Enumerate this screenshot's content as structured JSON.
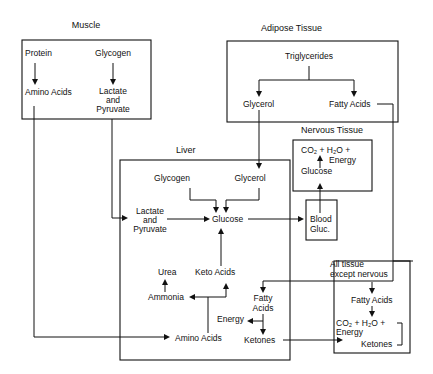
{
  "diagram": {
    "type": "metabolic-flow",
    "sections": {
      "muscle": {
        "title": "Muscle",
        "nodes": {
          "protein": "Protein",
          "glycogen": "Glycogen",
          "amino_acids": "Amino Acids",
          "lactate_1": "Lactate",
          "lactate_2": "and",
          "lactate_3": "Pyruvate"
        }
      },
      "adipose": {
        "title": "Adipose Tissue",
        "nodes": {
          "triglycerides": "Triglycerides",
          "glycerol": "Glycerol",
          "fatty_acids": "Fatty Acids"
        }
      },
      "nervous": {
        "title": "Nervous Tissue",
        "nodes": {
          "products": "CO₂ + H₂O +",
          "energy": "Energy",
          "glucose": "Glucose"
        }
      },
      "blood": {
        "nodes": {
          "line1": "Blood",
          "line2": "Gluc."
        }
      },
      "liver": {
        "title": "Liver",
        "nodes": {
          "glycogen": "Glycogen",
          "glycerol": "Glycerol",
          "lactate_1": "Lactate",
          "lactate_2": "and",
          "lactate_3": "Pyruvate",
          "glucose": "Glucose",
          "urea": "Urea",
          "keto_acids": "Keto Acids",
          "ammonia": "Ammonia",
          "fatty_1": "Fatty",
          "fatty_2": "Acids",
          "energy": "Energy",
          "amino_acids": "Amino Acids",
          "ketones": "Ketones"
        }
      },
      "all_tissue": {
        "title_1": "All tissue",
        "title_2": "except nervous",
        "nodes": {
          "fatty_acids": "Fatty Acids",
          "products": "CO₂ + H₂O +",
          "energy": "Energy",
          "ketones": "Ketones"
        }
      }
    },
    "edges": [
      [
        "Protein",
        "Amino Acids (muscle)"
      ],
      [
        "Glycogen (muscle)",
        "Lactate and Pyruvate (muscle)"
      ],
      [
        "Amino Acids (muscle)",
        "Amino Acids (liver)"
      ],
      [
        "Lactate and Pyruvate (muscle)",
        "Lactate and Pyruvate (liver)"
      ],
      [
        "Triglycerides",
        "Glycerol (adipose)"
      ],
      [
        "Triglycerides",
        "Fatty Acids (adipose)"
      ],
      [
        "Glycerol (adipose)",
        "Glycerol (liver)"
      ],
      [
        "Fatty Acids (adipose)",
        "Fatty Acids (liver)"
      ],
      [
        "Fatty Acids (adipose)",
        "Fatty Acids (all tissue)"
      ],
      [
        "Glycogen (liver)",
        "Glucose (liver)"
      ],
      [
        "Glycerol (liver)",
        "Glucose (liver)"
      ],
      [
        "Lactate and Pyruvate (liver)",
        "Glucose (liver)"
      ],
      [
        "Keto Acids",
        "Glucose (liver)"
      ],
      [
        "Glucose (liver)",
        "Blood Gluc."
      ],
      [
        "Blood Gluc.",
        "Glucose (nervous)"
      ],
      [
        "Glucose (nervous)",
        "CO2 + H2O + Energy"
      ],
      [
        "Amino Acids (liver)",
        "Keto Acids"
      ],
      [
        "Amino Acids (liver)",
        "Ammonia"
      ],
      [
        "Ammonia",
        "Urea"
      ],
      [
        "Fatty Acids (liver)",
        "Energy (liver)"
      ],
      [
        "Fatty Acids (liver)",
        "Ketones (liver)"
      ],
      [
        "Ketones (liver)",
        "Ketones (all tissue)"
      ],
      [
        "Fatty Acids (all tissue)",
        "CO2 + H2O + Energy (all tissue)"
      ],
      [
        "Ketones (all tissue)",
        "CO2 + H2O + Energy (all tissue)"
      ]
    ]
  }
}
